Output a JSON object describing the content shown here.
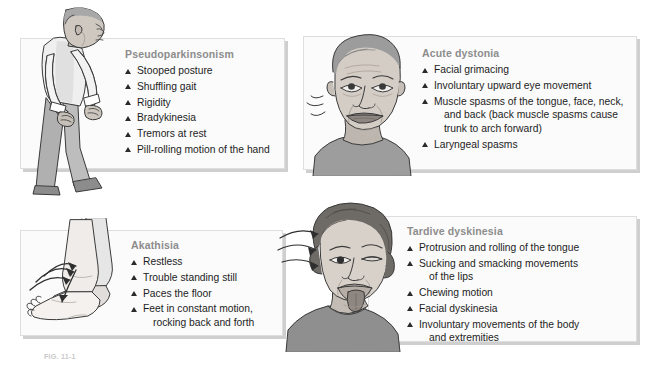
{
  "figure": {
    "caption": "FIG. 11-1"
  },
  "panels": [
    {
      "id": "pseudoparkinsonism",
      "title": "Pseudoparkinsonism",
      "illustration": "stooped-man-pill-rolling",
      "symptoms": [
        {
          "text": "Stooped posture"
        },
        {
          "text": "Shuffling gait"
        },
        {
          "text": "Rigidity"
        },
        {
          "text": "Bradykinesia"
        },
        {
          "text": "Tremors at rest"
        },
        {
          "text": "Pill-rolling motion of the hand"
        }
      ]
    },
    {
      "id": "acute-dystonia",
      "title": "Acute dystonia",
      "illustration": "grimacing-face-upward-eyes",
      "symptoms": [
        {
          "text": "Facial grimacing"
        },
        {
          "text": "Involuntary upward eye movement"
        },
        {
          "text": "Muscle spasms of the tongue, face, neck,",
          "cont": [
            "and back (back muscle spasms cause",
            "trunk to arch forward)"
          ]
        },
        {
          "text": "Laryngeal spasms"
        }
      ]
    },
    {
      "id": "akathisia",
      "title": "Akathisia",
      "illustration": "rocking-feet-motion-arrows",
      "symptoms": [
        {
          "text": "Restless"
        },
        {
          "text": "Trouble standing still"
        },
        {
          "text": "Paces the floor"
        },
        {
          "text": "Feet in constant motion,",
          "cont": [
            "rocking back and forth"
          ]
        }
      ]
    },
    {
      "id": "tardive-dyskinesia",
      "title": "Tardive dyskinesia",
      "illustration": "woman-protruding-tongue-head-roll",
      "symptoms": [
        {
          "text": "Protrusion and rolling of the tongue"
        },
        {
          "text": "Sucking and smacking movements",
          "cont": [
            "of the lips"
          ]
        },
        {
          "text": "Chewing motion"
        },
        {
          "text": "Facial dyskinesia"
        },
        {
          "text": "Involuntary movements of the body",
          "cont": [
            "and extremities"
          ]
        }
      ]
    }
  ],
  "colors": {
    "page_background": "#ffffff",
    "panel_background": "#fbfbfb",
    "panel_border": "#dedede",
    "panel_shadow": "#cfcfcf",
    "title_text": "#8d8d8d",
    "body_text": "#1d1d1d",
    "bullet_marker": "#2a2a2a",
    "skin_light": "#e8e4e0",
    "skin_mid": "#c9c2bb",
    "skin_shadow": "#a79f97",
    "hair_gray": "#9a9a9a",
    "hair_dark": "#6e6a66",
    "garment_light": "#efefef",
    "garment_mid": "#b9b9b9",
    "garment_dark": "#8e8e8e",
    "outline": "#3a3a3a"
  },
  "icons": {
    "bullet": "triangle-up-icon"
  }
}
